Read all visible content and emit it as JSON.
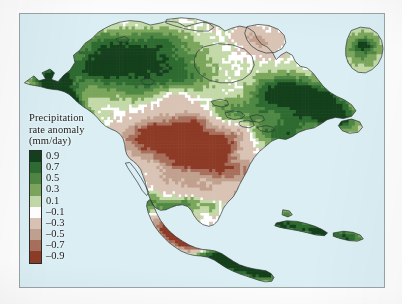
{
  "figure": {
    "background_color": "#fdfdfd",
    "frame_color": "#9aa3a6",
    "ocean_color": "#daeef3",
    "land_blank_color": "#ffffff",
    "coastline_color": "#2f3638"
  },
  "legend": {
    "title_line1": "Precipitation",
    "title_line2": "rate anomaly",
    "title_line3": "(mm/day)",
    "title_text": "Precipitation\nrate anomaly\n(mm/day)",
    "units": "mm/day",
    "tick_labels": [
      "0.9",
      "0.7",
      "0.5",
      "0.3",
      "0.1",
      "–0.1",
      "–0.3",
      "–0.5",
      "–0.7",
      "–0.9"
    ],
    "swatch_colors": [
      "#14401c",
      "#2e6b31",
      "#4f8744",
      "#7ba65c",
      "#c3d9a8",
      "#ffffff",
      "#d9c3b4",
      "#c1a08e",
      "#a8705c",
      "#8d3b26"
    ]
  },
  "chart_data": {
    "type": "heatmap",
    "title": "Precipitation rate anomaly",
    "subtitle": "North America",
    "xlabel": "longitude",
    "ylabel": "latitude",
    "zlabel": "Precipitation rate anomaly (mm/day)",
    "colormap": "diverging green-brown (BrBG reversed)",
    "grid": false,
    "legend_position": "inset-left",
    "projection": "lambert-conformal-like regional map of North America",
    "value_unit": "mm/day",
    "color_levels": [
      {
        "label": "0.9",
        "value": 0.9,
        "color": "#14401c"
      },
      {
        "label": "0.7",
        "value": 0.7,
        "color": "#2e6b31"
      },
      {
        "label": "0.5",
        "value": 0.5,
        "color": "#4f8744"
      },
      {
        "label": "0.3",
        "value": 0.3,
        "color": "#7ba65c"
      },
      {
        "label": "0.1",
        "value": 0.1,
        "color": "#c3d9a8"
      },
      {
        "label": "-0.1",
        "value": -0.1,
        "color": "#ffffff"
      },
      {
        "label": "-0.3",
        "value": -0.3,
        "color": "#d9c3b4"
      },
      {
        "label": "-0.5",
        "value": -0.5,
        "color": "#c1a08e"
      },
      {
        "label": "-0.7",
        "value": -0.7,
        "color": "#a8705c"
      },
      {
        "label": "-0.9",
        "value": -0.9,
        "color": "#8d3b26"
      }
    ],
    "zlim": [
      -0.9,
      0.9
    ],
    "regions": [
      {
        "name": "Pacific coast Alaska / British Columbia",
        "value": 0.9,
        "sign": "positive"
      },
      {
        "name": "Interior Alaska and Yukon",
        "value": 0.5,
        "sign": "positive"
      },
      {
        "name": "Northwest Territories / boreal Canada",
        "value": 0.3,
        "sign": "positive"
      },
      {
        "name": "Canadian Arctic archipelago patch",
        "value": -0.3,
        "sign": "negative"
      },
      {
        "name": "Hudson Bay west shore",
        "value": -0.3,
        "sign": "negative"
      },
      {
        "name": "Quebec / Labrador",
        "value": 0.7,
        "sign": "positive"
      },
      {
        "name": "Greenland southwest",
        "value": 0.3,
        "sign": "positive"
      },
      {
        "name": "US Great Plains and Midwest",
        "value": -0.5,
        "sign": "negative"
      },
      {
        "name": "US Southwest / Rockies",
        "value": -0.3,
        "sign": "negative"
      },
      {
        "name": "US Northeast and Great Lakes",
        "value": 0.3,
        "sign": "positive"
      },
      {
        "name": "US Southeast / Gulf coast",
        "value": -0.3,
        "sign": "negative"
      },
      {
        "name": "Pacific coast southern Mexico",
        "value": -0.9,
        "sign": "negative"
      },
      {
        "name": "Central America",
        "value": 0.9,
        "sign": "positive"
      },
      {
        "name": "Caribbean / Greater Antilles",
        "value": 0.7,
        "sign": "positive"
      }
    ]
  }
}
